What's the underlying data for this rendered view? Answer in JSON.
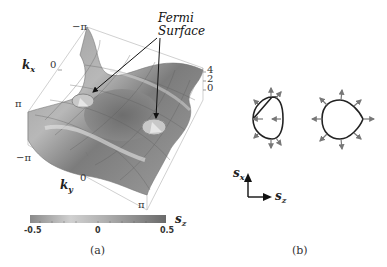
{
  "panel_a": {
    "caption": "(a)",
    "annotation": {
      "line1": "Fermi",
      "line2": "Surface"
    },
    "axes": {
      "kx": {
        "label": "k",
        "sub": "x",
        "ticks": [
          "−π",
          "0",
          "π"
        ]
      },
      "ky": {
        "label": "k",
        "sub": "y",
        "ticks": [
          "−π",
          "0",
          "π"
        ]
      },
      "energy": {
        "ticks": [
          "4",
          "2",
          "0"
        ]
      }
    },
    "colorbar": {
      "label": "s",
      "sub": "z",
      "ticks": [
        "-0.5",
        "0",
        "0.5"
      ],
      "gradient": [
        "#8a8a8a",
        "#cfcfcf",
        "#a8a8a8",
        "#6e6e6e"
      ]
    }
  },
  "panel_b": {
    "caption": "(b)",
    "axes": {
      "vertical": {
        "label": "s",
        "sub": "x"
      },
      "horizontal": {
        "label": "s",
        "sub": "z"
      }
    },
    "contours": [
      {
        "name": "left-pocket",
        "spin_texture": "arrows mixed inward/outward"
      },
      {
        "name": "right-pocket",
        "spin_texture": "arrows outward"
      }
    ]
  }
}
